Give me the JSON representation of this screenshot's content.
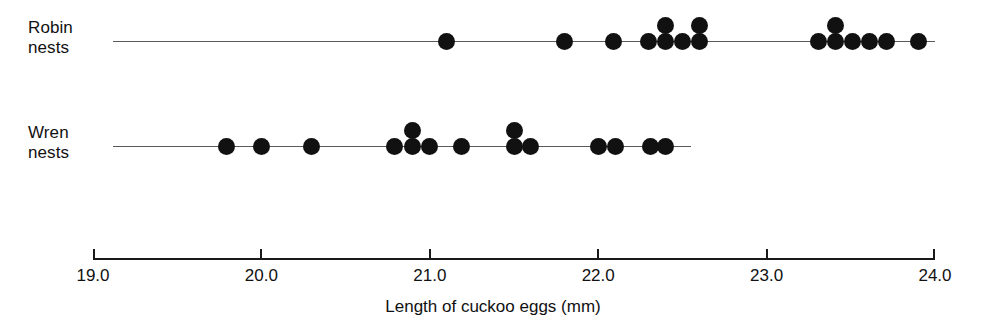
{
  "chart_data": {
    "type": "scatter",
    "plot_style": "dot-plot",
    "title": "",
    "xlabel": "Length of cuckoo eggs (mm)",
    "ylabel": "",
    "xlim": [
      19.0,
      24.0
    ],
    "xticks": [
      19.0,
      20.0,
      21.0,
      22.0,
      23.0,
      24.0
    ],
    "xtick_labels": [
      "19.0",
      "20.0",
      "21.0",
      "22.0",
      "23.0",
      "24.0"
    ],
    "grid": false,
    "legend": false,
    "dot_color": "#111111",
    "axis_color": "#1a1a1a",
    "series": [
      {
        "name": "Robin nests",
        "label": "Robin\nnests",
        "axis_start": 19.12,
        "axis_end": 24.0,
        "values": [
          21.1,
          21.8,
          22.09,
          22.3,
          22.4,
          22.4,
          22.5,
          22.6,
          22.6,
          23.31,
          23.41,
          23.41,
          23.51,
          23.61,
          23.71,
          23.9
        ]
      },
      {
        "name": "Wren nests",
        "label": "Wren\nnests",
        "axis_start": 19.12,
        "axis_end": 22.55,
        "values": [
          19.79,
          20.0,
          20.3,
          20.79,
          20.9,
          20.9,
          21.0,
          21.19,
          21.5,
          21.5,
          21.6,
          22.0,
          22.1,
          22.31,
          22.4
        ]
      }
    ]
  }
}
